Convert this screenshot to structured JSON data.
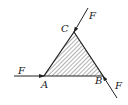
{
  "diagram": {
    "vertices": {
      "A": {
        "label": "A",
        "x": 44,
        "y": 76
      },
      "B": {
        "label": "B",
        "x": 103,
        "y": 76
      },
      "C": {
        "label": "C",
        "x": 74,
        "y": 32
      }
    },
    "forces": [
      {
        "label": "F",
        "at": "A",
        "direction": "horizontal, pointing right into A"
      },
      {
        "label": "F",
        "at": "B",
        "direction": "along line through B, pointing up-left into B"
      },
      {
        "label": "F",
        "at": "C",
        "direction": "along line through C, pointing down-left into C"
      }
    ],
    "fill": "hatched",
    "colors": {
      "stroke": "#222222",
      "hatch": "#555555",
      "background": "#ffffff"
    }
  }
}
